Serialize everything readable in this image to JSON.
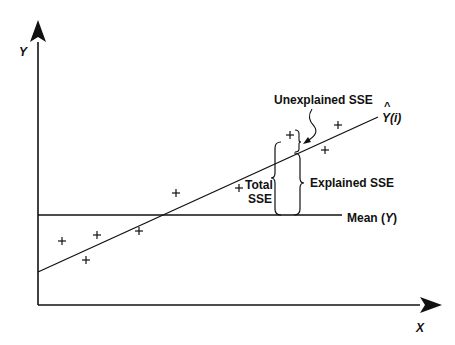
{
  "diagram": {
    "axes": {
      "x_label": "X",
      "y_label": "Y"
    },
    "lines": {
      "regression_label_hat": "^",
      "regression_label": "Y(i)",
      "mean_label_prefix": "Mean (",
      "mean_label_var": "Y",
      "mean_label_suffix": ")"
    },
    "annotations": {
      "unexplained": "Unexplained SSE",
      "explained": "Explained SSE",
      "total_line1": "Total",
      "total_line2": "SSE"
    },
    "marker_symbol": "+",
    "points_count": 9,
    "color": "#111111"
  }
}
